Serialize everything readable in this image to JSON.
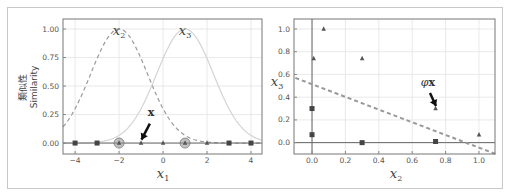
{
  "chart_data": [
    {
      "type": "line",
      "title": "",
      "xlabel": "x1",
      "ylabel": "類似性 / Similarity",
      "ylabel_ja": "類似性",
      "ylabel_en": "Similarity",
      "xlim": [
        -4.5,
        4.5
      ],
      "ylim": [
        -0.1,
        1.1
      ],
      "xticks": [
        "−4",
        "−2",
        "0",
        "2",
        "4"
      ],
      "yticks": [
        "0.00",
        "0.25",
        "0.50",
        "0.75",
        "1.00"
      ],
      "grid": true,
      "series": [
        {
          "name": "x2",
          "style": "dashed",
          "function": "exp(-0.3*(x+2)^2)",
          "landmark": -2
        },
        {
          "name": "x3",
          "style": "solid-light",
          "function": "exp(-0.3*(x-1)^2)",
          "landmark": 1
        }
      ],
      "points": {
        "squares": [
          -4,
          -3,
          3,
          4
        ],
        "triangles": [
          -2,
          -1,
          0,
          1,
          2
        ],
        "landmarks": [
          -2,
          1
        ]
      },
      "annotations": [
        {
          "text": "x",
          "arrow_to": [
            -1,
            0
          ],
          "bold": true
        },
        {
          "text": "x2",
          "at": [
            -2,
            1.0
          ]
        },
        {
          "text": "x3",
          "at": [
            1,
            1.0
          ]
        }
      ]
    },
    {
      "type": "scatter",
      "title": "",
      "xlabel": "x2",
      "ylabel": "x3",
      "xlim": [
        -0.1,
        1.1
      ],
      "ylim": [
        -0.1,
        1.1
      ],
      "xticks": [
        "0.0",
        "0.2",
        "0.4",
        "0.6",
        "0.8",
        "1.0"
      ],
      "yticks": [
        "0.0",
        "0.2",
        "0.4",
        "0.6",
        "0.8",
        "1.0"
      ],
      "grid": true,
      "series": [
        {
          "name": "class 0 (squares)",
          "marker": "square",
          "points": [
            [
              0.3,
              0.0
            ],
            [
              0.74,
              0.01
            ],
            [
              0.0,
              0.3
            ],
            [
              0.0,
              0.07
            ]
          ]
        },
        {
          "name": "class 1 (triangles)",
          "marker": "triangle",
          "points": [
            [
              1.0,
              0.07
            ],
            [
              0.74,
              0.3
            ],
            [
              0.3,
              0.74
            ],
            [
              0.07,
              1.0
            ],
            [
              0.01,
              0.74
            ]
          ]
        }
      ],
      "decision_boundary": {
        "style": "dashed",
        "from": [
          -0.1,
          0.57
        ],
        "to": [
          1.1,
          -0.1
        ]
      },
      "annotations": [
        {
          "text": "φx",
          "arrow_to": [
            0.74,
            0.3
          ],
          "bold": true
        }
      ]
    }
  ]
}
